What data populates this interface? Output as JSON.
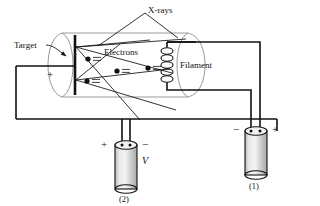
{
  "diagram": {
    "labels": {
      "xrays": "X-rays",
      "target": "Target",
      "electrons": "Electrons",
      "filament": "Filament",
      "voltage": "V"
    },
    "target_polarity": "+",
    "battery_1": {
      "id": "(1)",
      "left_terminal": "−",
      "right_terminal": "+"
    },
    "battery_2": {
      "id": "(2)",
      "left_terminal": "+",
      "right_terminal": "−",
      "label": "V"
    },
    "electron_count": 4,
    "filament_coil_loops": 5,
    "colors": {
      "line": "#111111",
      "tube_outline": "#9a9a9a",
      "battery_fill": "#cccccc",
      "background": "#ffffff"
    }
  }
}
